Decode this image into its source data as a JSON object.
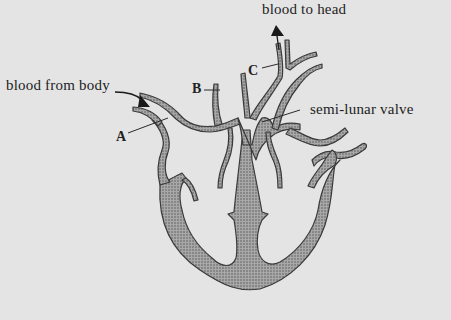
{
  "diagram": {
    "labels": {
      "blood_to_head": "blood to head",
      "blood_from_body": "blood from body",
      "semi_lunar_valve": "semi-lunar valve",
      "A": "A",
      "B": "B",
      "C": "C"
    },
    "colors": {
      "background": "#e4e4e4",
      "tissue_fill": "#9a9a9a",
      "outline": "#3a3a3a",
      "text": "#222222"
    }
  }
}
